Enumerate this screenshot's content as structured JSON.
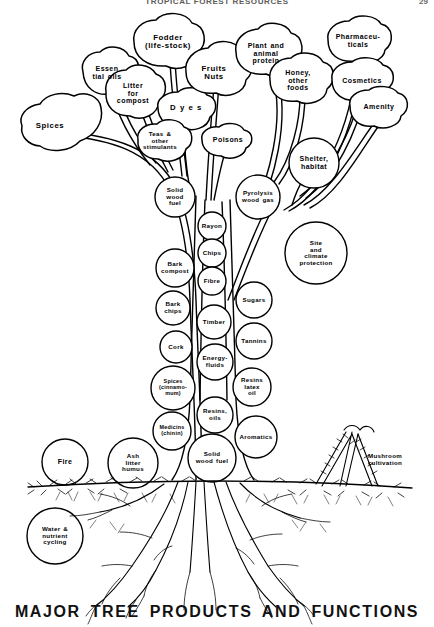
{
  "page": {
    "running_head": "TROPICAL FOREST RESOURCES",
    "folio": "29",
    "figure_title": "MAJOR TREE PRODUCTS AND FUNCTIONS"
  },
  "diagram": {
    "type": "tree-schematic",
    "colors": {
      "ink": "#000000",
      "paper": "#ffffff",
      "runhead": "#5c5c5c"
    },
    "canopy": [
      {
        "id": "spices",
        "label": "Spices",
        "x": 50,
        "y": 126,
        "size": "s8"
      },
      {
        "id": "essential-oils",
        "label": "Essen\ntial oils",
        "x": 107,
        "y": 73,
        "size": "s7"
      },
      {
        "id": "litter-compost",
        "label": "Litter\nfor\ncompost",
        "x": 133,
        "y": 93,
        "size": "s7"
      },
      {
        "id": "fodder",
        "label": "Fodder\n(life-stock)",
        "x": 168,
        "y": 42,
        "size": "s8"
      },
      {
        "id": "dyes",
        "label": "D y e s",
        "x": 186,
        "y": 108,
        "size": "s8"
      },
      {
        "id": "teas",
        "label": "Teas &\nother\nstimulants",
        "x": 160,
        "y": 141,
        "size": "s6"
      },
      {
        "id": "fruits-nuts",
        "label": "Fruits\nNuts",
        "x": 214,
        "y": 73,
        "size": "s8"
      },
      {
        "id": "poisons",
        "label": "Poisons",
        "x": 228,
        "y": 140,
        "size": "s7"
      },
      {
        "id": "plant-protein",
        "label": "Plant and\nanimal\nprotein",
        "x": 266,
        "y": 53,
        "size": "s7"
      },
      {
        "id": "honey",
        "label": "Honey,\nother\nfoods",
        "x": 298,
        "y": 80,
        "size": "s7"
      },
      {
        "id": "pharmaceutical",
        "label": "Pharmaceu-\nticals",
        "x": 358,
        "y": 41,
        "size": "s7"
      },
      {
        "id": "cosmetics",
        "label": "Cosmetics",
        "x": 362,
        "y": 81,
        "size": "s7"
      },
      {
        "id": "amenity",
        "label": "Amenity",
        "x": 379,
        "y": 107,
        "size": "s7"
      }
    ],
    "branch_circles": [
      {
        "id": "shelter-habitat",
        "label": "Shelter,\nhabitat",
        "x": 314,
        "y": 163,
        "size": "s7"
      },
      {
        "id": "solid-wood-fuel-top",
        "label": "Solid\nwood\nfuel",
        "x": 175,
        "y": 197,
        "size": "s6"
      },
      {
        "id": "pyrolysis",
        "label": "Pyrolysis\nwood gas",
        "x": 258,
        "y": 197,
        "size": "s6"
      },
      {
        "id": "site-climate",
        "label": "Site\nand\nclimate\nprotection",
        "x": 316,
        "y": 253,
        "size": "s6"
      }
    ],
    "trunk_center": [
      {
        "id": "rayon",
        "label": "Rayon",
        "x": 212,
        "y": 226,
        "size": "s6"
      },
      {
        "id": "chips",
        "label": "Chips",
        "x": 212,
        "y": 253,
        "size": "s6"
      },
      {
        "id": "fibre",
        "label": "Fibre",
        "x": 212,
        "y": 281,
        "size": "s6"
      },
      {
        "id": "timber",
        "label": "Timber",
        "x": 214,
        "y": 322,
        "size": "s6"
      },
      {
        "id": "energy-fluids",
        "label": "Energy-\nfluids",
        "x": 215,
        "y": 362,
        "size": "s6"
      },
      {
        "id": "resins-oils",
        "label": "Resins,\noils",
        "x": 215,
        "y": 415,
        "size": "s6"
      },
      {
        "id": "solid-wood-fuel-base",
        "label": "Solid\nwood  fuel",
        "x": 212,
        "y": 458,
        "size": "s6"
      }
    ],
    "trunk_left": [
      {
        "id": "bark-compost",
        "label": "Bark\ncompost",
        "x": 175,
        "y": 268,
        "size": "s6"
      },
      {
        "id": "bark-chips",
        "label": "Bark\nchips",
        "x": 173,
        "y": 308,
        "size": "s6"
      },
      {
        "id": "cork",
        "label": "Cork",
        "x": 176,
        "y": 347,
        "size": "s6"
      },
      {
        "id": "spices-cinn",
        "label": "Spices\n(cinnamo-\nmum)",
        "x": 173,
        "y": 388,
        "size": "s5"
      },
      {
        "id": "medicins",
        "label": "Medicins\n(chinin)",
        "x": 172,
        "y": 431,
        "size": "s5"
      }
    ],
    "trunk_right": [
      {
        "id": "sugars",
        "label": "Sugars",
        "x": 254,
        "y": 300,
        "size": "s6"
      },
      {
        "id": "tannins",
        "label": "Tannins",
        "x": 254,
        "y": 341,
        "size": "s6"
      },
      {
        "id": "resins-latex",
        "label": "Resins\nlatex\noil",
        "x": 252,
        "y": 387,
        "size": "s6"
      },
      {
        "id": "aromatics",
        "label": "Aromatics",
        "x": 256,
        "y": 437,
        "size": "s6"
      }
    ],
    "ground": [
      {
        "id": "fire",
        "label": "Fire",
        "x": 65,
        "y": 462,
        "size": "s7"
      },
      {
        "id": "ash-litter",
        "label": "Ash\nlitter\nhumus",
        "x": 133,
        "y": 463,
        "size": "s6"
      },
      {
        "id": "water-cycle",
        "label": "Water &\nnutrient\ncycling",
        "x": 55,
        "y": 536,
        "size": "s6"
      }
    ],
    "annotations": [
      {
        "id": "mushroom-cultivation",
        "label": "Mushroom\ncultivation",
        "x": 385,
        "y": 460,
        "size": "s6"
      }
    ]
  }
}
